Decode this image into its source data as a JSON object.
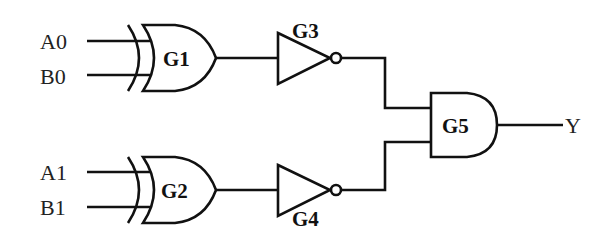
{
  "diagram": {
    "type": "logic-circuit",
    "inputs": [
      {
        "id": "A0",
        "label": "A0"
      },
      {
        "id": "B0",
        "label": "B0"
      },
      {
        "id": "A1",
        "label": "A1"
      },
      {
        "id": "B1",
        "label": "B1"
      }
    ],
    "output": {
      "id": "Y",
      "label": "Y"
    },
    "gates": [
      {
        "id": "G1",
        "label": "G1",
        "kind": "XOR",
        "inputs": [
          "A0",
          "B0"
        ]
      },
      {
        "id": "G2",
        "label": "G2",
        "kind": "XOR",
        "inputs": [
          "A1",
          "B1"
        ]
      },
      {
        "id": "G3",
        "label": "G3",
        "kind": "NOT",
        "inputs": [
          "G1"
        ]
      },
      {
        "id": "G4",
        "label": "G4",
        "kind": "NOT",
        "inputs": [
          "G2"
        ]
      },
      {
        "id": "G5",
        "label": "G5",
        "kind": "AND",
        "inputs": [
          "G3",
          "G4"
        ]
      }
    ]
  }
}
